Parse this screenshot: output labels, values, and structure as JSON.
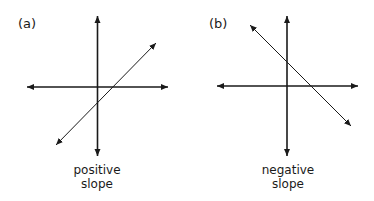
{
  "panels": [
    {
      "id": "a",
      "label": "(a)",
      "caption_line1": "positive",
      "caption_line2": "slope"
    },
    {
      "id": "b",
      "label": "(b)",
      "caption_line1": "negative",
      "caption_line2": "slope"
    }
  ],
  "colors": {
    "line": "#1a1a1a",
    "background": "#ffffff"
  }
}
